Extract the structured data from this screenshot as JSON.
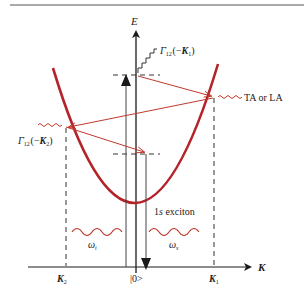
{
  "diagram": {
    "axes": {
      "energy_label": "E",
      "momentum_label": "K",
      "ground_state_label": "|0>"
    },
    "tick_labels": {
      "k2_main": "K",
      "k2_sub": "2",
      "k1_main": "K",
      "k1_sub": "1"
    },
    "labels": {
      "gamma_k1_main": "Γ",
      "gamma_k1_sub": "12",
      "gamma_k1_sup": "−",
      "gamma_k1_arg_open": " (−",
      "gamma_k1_arg_k": "K",
      "gamma_k1_arg_sub": "1",
      "gamma_k1_arg_close": ")",
      "gamma_k2_main": "Γ",
      "gamma_k2_sub": "12",
      "gamma_k2_sup": "−",
      "gamma_k2_arg_open": " (−",
      "gamma_k2_arg_k": "K",
      "gamma_k2_arg_sub": "2",
      "gamma_k2_arg_close": ")",
      "phonon_label": "TA or LA",
      "exciton_label_num": "1",
      "exciton_label_s": "s",
      "exciton_label_rest": " exciton",
      "omega_i_main": "ω",
      "omega_i_sub": "i",
      "omega_s_main": "ω",
      "omega_s_sub": "s"
    },
    "colors": {
      "dispersion_curve": "#b5232a",
      "transition_arrows": "#c0392b",
      "axes": "#1a1a1a",
      "dashed_lines": "#333333",
      "photon_waves": "#c0392b"
    }
  }
}
